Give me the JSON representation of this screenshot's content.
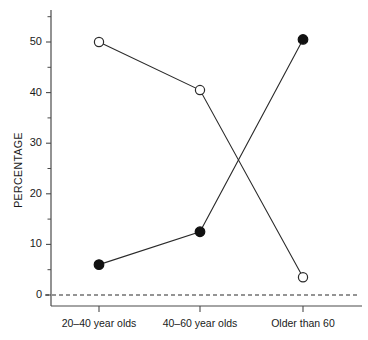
{
  "chart_data": {
    "type": "line",
    "title": "",
    "subtitle": "",
    "xlabel": "",
    "ylabel": "PERCENTAGE",
    "categories": [
      "20–40 year olds",
      "40–60 year olds",
      "Older than 60"
    ],
    "ylim": [
      0,
      55
    ],
    "xlim": [
      0,
      3
    ],
    "grid": false,
    "legend": "none",
    "y_major_ticks": [
      0,
      10,
      20,
      30,
      40,
      50
    ],
    "y_major_tick_labels": [
      "0",
      "10",
      "20",
      "30",
      "40",
      "50"
    ],
    "y_minor_ticks": [
      5,
      15,
      25,
      35,
      45,
      55
    ],
    "annotations": [
      {
        "name": "zero-reference-line",
        "value": 0,
        "style": "dashed"
      }
    ],
    "series": [
      {
        "name": "Open circles series",
        "marker": "open-circle",
        "values": [
          50,
          40.5,
          3.5
        ]
      },
      {
        "name": "Filled circles series",
        "marker": "filled-circle",
        "values": [
          6,
          12.5,
          50.5
        ]
      }
    ]
  },
  "colors": {
    "line": "#2a2a2a",
    "axis": "#4a4a4a",
    "marker_fill_open": "#ffffff",
    "marker_fill_closed": "#111111",
    "background": "#ffffff"
  }
}
